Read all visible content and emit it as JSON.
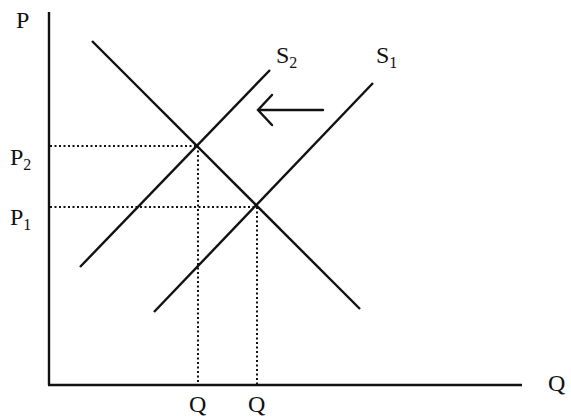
{
  "title": "",
  "colors": {
    "line": "#111111",
    "background": "#ffffff"
  },
  "axes": {
    "y_label": "P",
    "x_label": "Q"
  },
  "price_labels": [
    {
      "base": "P",
      "sub": "2"
    },
    {
      "base": "P",
      "sub": "1"
    }
  ],
  "quantity_labels": [
    "Q",
    "Q"
  ],
  "curves": {
    "demand": {
      "name": ""
    },
    "supply_new": {
      "base": "S",
      "sub": "2"
    },
    "supply_old": {
      "base": "S",
      "sub": "1"
    }
  },
  "annotation": {
    "arrow_direction": "left",
    "meaning": "supply shift"
  }
}
